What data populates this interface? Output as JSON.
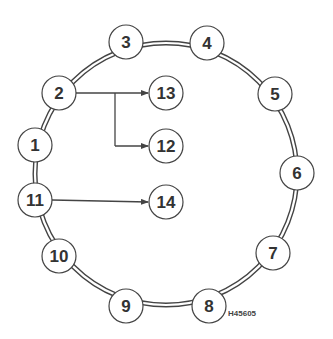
{
  "diagram": {
    "type": "ring-network",
    "ring": {
      "center": [
        166,
        174
      ],
      "rx": 131,
      "ry": 131,
      "style": "double-line",
      "stroke": "#444444"
    },
    "node_radius": 17,
    "ring_nodes": [
      {
        "id": "1",
        "label": "1",
        "x": 35,
        "y": 145
      },
      {
        "id": "2",
        "label": "2",
        "x": 59,
        "y": 93
      },
      {
        "id": "3",
        "label": "3",
        "x": 126,
        "y": 42
      },
      {
        "id": "4",
        "label": "4",
        "x": 207,
        "y": 43
      },
      {
        "id": "5",
        "label": "5",
        "x": 275,
        "y": 94
      },
      {
        "id": "6",
        "label": "6",
        "x": 297,
        "y": 173
      },
      {
        "id": "7",
        "label": "7",
        "x": 273,
        "y": 253
      },
      {
        "id": "8",
        "label": "8",
        "x": 209,
        "y": 306
      },
      {
        "id": "9",
        "label": "9",
        "x": 126,
        "y": 306
      },
      {
        "id": "10",
        "label": "10",
        "x": 59,
        "y": 256
      },
      {
        "id": "11",
        "label": "11",
        "x": 35,
        "y": 200
      }
    ],
    "branch_nodes": [
      {
        "id": "13",
        "label": "13",
        "x": 166,
        "y": 93
      },
      {
        "id": "12",
        "label": "12",
        "x": 166,
        "y": 146
      },
      {
        "id": "14",
        "label": "14",
        "x": 166,
        "y": 202
      }
    ],
    "arrows": [
      {
        "from": "2",
        "to": "13"
      },
      {
        "from": "2",
        "to": "12",
        "via": "branch-at-x-115"
      },
      {
        "from": "11",
        "to": "14"
      }
    ],
    "figure_code": "H45605"
  }
}
